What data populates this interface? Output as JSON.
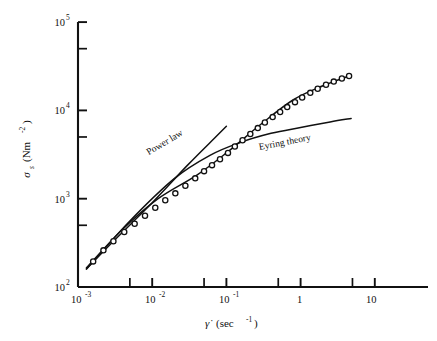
{
  "figure": {
    "name": "shear-stress-vs-shear-rate-log-log-plot",
    "background": "#ffffff",
    "ink_color": "#111111"
  },
  "axes": {
    "x": {
      "label_main": "γ̇",
      "label_units": "(sec",
      "label_units_exp": "-1",
      "label_units_close": ")",
      "label_full": "γ̇ (sec⁻¹)",
      "scale": "log",
      "min": 0.001,
      "max": 10,
      "tick_labels": [
        "10",
        "10",
        "10",
        "1",
        "10"
      ],
      "tick_exponents": [
        "-3",
        "-2",
        "-1",
        "",
        ""
      ],
      "tick_values": [
        0.001,
        0.01,
        0.1,
        1,
        10
      ],
      "minor_ticks": [
        0.005,
        0.05,
        0.5,
        5
      ]
    },
    "y": {
      "label_main": "σ",
      "label_sub": "s",
      "label_units": "(Nm",
      "label_units_exp": "-2",
      "label_units_close": ")",
      "label_full": "σs (Nm⁻²)",
      "scale": "log",
      "min": 100,
      "max": 100000,
      "tick_labels": [
        "10",
        "10",
        "10",
        "10"
      ],
      "tick_exponents": [
        "2",
        "3",
        "4",
        "5"
      ],
      "tick_values": [
        100,
        1000,
        10000,
        100000
      ],
      "minor_ticks": [
        500,
        5000,
        50000
      ]
    }
  },
  "annotations": [
    {
      "id": "power-law-label",
      "text": "Power law",
      "x_data": 0.009,
      "y_data": 3100,
      "rotation_deg": -31
    },
    {
      "id": "eyring-theory-label",
      "text": "Eyring theory",
      "x_data": 0.28,
      "y_data": 3550,
      "rotation_deg": -11
    }
  ],
  "chart_data": {
    "type": "scatter",
    "title": "",
    "subtitle": "",
    "xlabel": "γ̇ (sec⁻¹)",
    "ylabel": "σs (Nm⁻²)",
    "xscale": "log",
    "yscale": "log",
    "xlim": [
      0.001,
      10
    ],
    "ylim": [
      100,
      100000
    ],
    "grid": false,
    "legend_position": "inline-annotations",
    "series": [
      {
        "name": "Experimental data",
        "marker": "open-circle",
        "type": "scatter",
        "x": [
          0.0016,
          0.0022,
          0.003,
          0.0042,
          0.0058,
          0.008,
          0.011,
          0.015,
          0.0205,
          0.028,
          0.038,
          0.05,
          0.064,
          0.082,
          0.105,
          0.13,
          0.165,
          0.21,
          0.265,
          0.33,
          0.42,
          0.53,
          0.66,
          0.84,
          1.05,
          1.35,
          1.7,
          2.2,
          2.8,
          3.6,
          4.5
        ],
        "y": [
          195,
          260,
          330,
          420,
          520,
          640,
          790,
          960,
          1150,
          1400,
          1700,
          2050,
          2400,
          2800,
          3300,
          3900,
          4600,
          5400,
          6300,
          7300,
          8400,
          9600,
          10900,
          12400,
          14000,
          15800,
          17600,
          19500,
          21200,
          23000,
          24500
        ]
      },
      {
        "name": "Power law",
        "type": "line",
        "x": [
          0.0013,
          0.003,
          0.01,
          0.03,
          0.07,
          0.1
        ],
        "y": [
          160,
          330,
          900,
          2400,
          4900,
          6600
        ]
      },
      {
        "name": "Eyring theory",
        "type": "line",
        "x": [
          0.0013,
          0.005,
          0.02,
          0.06,
          0.15,
          0.4,
          1.0,
          2.5,
          4.8
        ],
        "y": [
          160,
          560,
          1700,
          3100,
          4300,
          5500,
          6400,
          7400,
          8100
        ]
      },
      {
        "name": "Data fit curve",
        "type": "line",
        "x": [
          0.0013,
          0.004,
          0.012,
          0.04,
          0.1,
          0.3,
          0.8,
          2.0,
          4.8
        ],
        "y": [
          165,
          450,
          1000,
          1850,
          3300,
          7100,
          13200,
          19000,
          25000
        ]
      }
    ]
  }
}
